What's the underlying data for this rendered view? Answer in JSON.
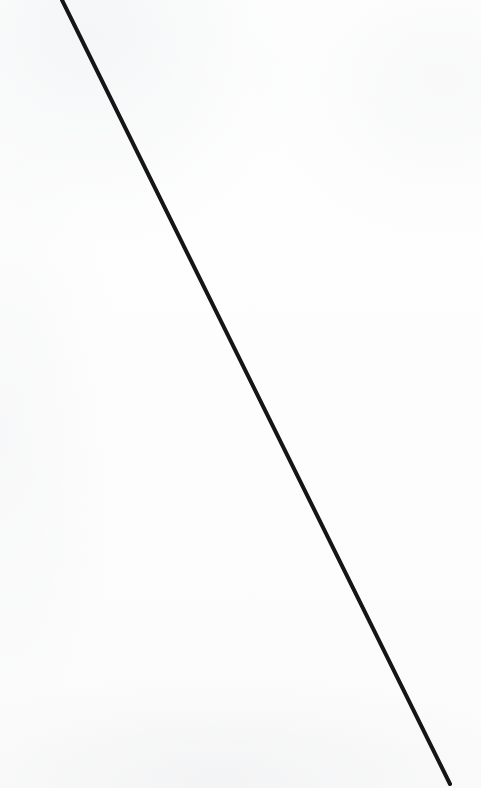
{
  "figure": {
    "name": "diagonal-line-figure",
    "width": 481,
    "height": 788,
    "background_color": "#fdfdfd",
    "caption": ""
  },
  "chart_data": {
    "type": "line",
    "title": "",
    "subtitle": "",
    "xlabel": "",
    "ylabel": "",
    "grid": false,
    "legend": null,
    "axes_visible": false,
    "tick_labels": [],
    "annotations": [],
    "xlim": [
      0,
      481
    ],
    "ylim": [
      0,
      788
    ],
    "series": [
      {
        "name": "diagonal-stroke",
        "color": "#151515",
        "stroke_width": 4,
        "linecap": "round",
        "x": [
          62,
          158,
          250,
          304,
          352,
          450
        ],
        "y": [
          0,
          200,
          394,
          500,
          600,
          784
        ],
        "start_point": [
          62,
          0
        ],
        "end_point": [
          450,
          784
        ],
        "slope": 0.49
      }
    ]
  }
}
